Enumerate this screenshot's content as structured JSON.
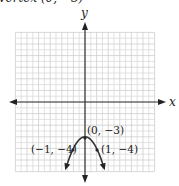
{
  "caption": "Vertex   (0, −3)",
  "chart_data": {
    "type": "line",
    "title": "",
    "xlabel": "x",
    "ylabel": "y",
    "xlim": [
      -6,
      6
    ],
    "ylim": [
      -6,
      6
    ],
    "grid": true,
    "series": [
      {
        "name": "y = -x^2 - 3",
        "equation": "y = -x^2 - 3",
        "x": [
          -1.6,
          -1.2,
          -1,
          -0.6,
          -0.3,
          0,
          0.3,
          0.6,
          1,
          1.2,
          1.6
        ],
        "y": [
          -5.56,
          -4.44,
          -4,
          -3.36,
          -3.09,
          -3,
          -3.09,
          -3.36,
          -4,
          -4.44,
          -5.56
        ]
      }
    ],
    "annotations": [
      {
        "label": "(0, −3)",
        "x": 0,
        "y": -3
      },
      {
        "label": "(−1, −4)",
        "x": -1,
        "y": -4
      },
      {
        "label": "(1, −4)",
        "x": 1,
        "y": -4
      }
    ]
  },
  "labels": {
    "x_axis": "x",
    "y_axis": "y",
    "vertex": "(0, −3)",
    "left_point": "(−1, −4)",
    "right_point": "(1, −4)"
  }
}
